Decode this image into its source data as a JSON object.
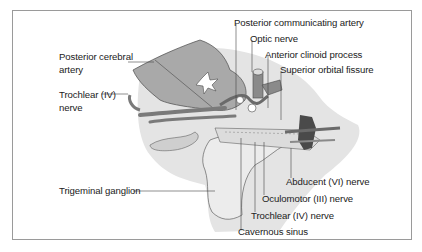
{
  "figure": {
    "type": "anatomical-illustration",
    "colors": {
      "background_blob": "#e4e4e4",
      "lobe_fill": "#a9a9a9",
      "vessel_fill": "#7a7a7a",
      "outline": "#4a4a4a",
      "leader_line": "#444444",
      "frame_border": "#9a9a9a"
    }
  },
  "labels": {
    "posterior_cerebral_artery": [
      "Posterior cerebral",
      "artery"
    ],
    "trochlear_nerve_left": [
      "Trochlear (IV) —",
      "nerve"
    ],
    "trigeminal_ganglion": "Trigeminal ganglion",
    "posterior_communicating_artery": "Posterior communicating artery",
    "optic_nerve": "Optic nerve",
    "anterior_clinoid_process": "Anterior clinoid process",
    "superior_orbital_fissure": "Superior orbital fissure",
    "abducent_nerve": "Abducent (VI) nerve",
    "oculomotor_nerve": "Oculomotor (III) nerve",
    "trochlear_nerve_bottom": "Trochlear (IV) nerve",
    "cavernous_sinus": "Cavernous sinus"
  }
}
